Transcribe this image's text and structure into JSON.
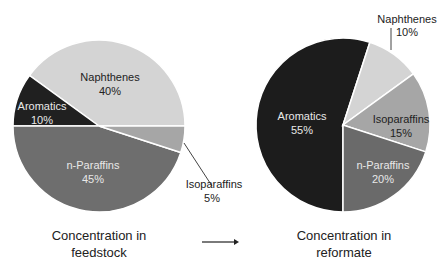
{
  "chart_data": [
    {
      "type": "pie",
      "title": "Concentration in feedstock",
      "categories": [
        "Naphthenes",
        "Aromatics",
        "n-Paraffins",
        "Isoparaffins"
      ],
      "values": [
        40,
        10,
        45,
        5
      ],
      "labels": [
        "40%",
        "10%",
        "45%",
        "5%"
      ],
      "colors": [
        "#d4d4d4",
        "#202020",
        "#6e6e6e",
        "#a6a6a6"
      ],
      "label_colors": [
        "#222222",
        "#e8e8e8",
        "#e8e8e8",
        "#222222"
      ],
      "center": [
        99,
        126
      ],
      "radius": 86,
      "start_angles_deg": [
        0,
        144,
        180,
        -18
      ],
      "external_labels": [
        "Isoparaffins"
      ]
    },
    {
      "type": "pie",
      "title": "Concentration in reformate",
      "categories": [
        "Aromatics",
        "Naphthenes",
        "Isoparaffins",
        "n-Paraffins"
      ],
      "values": [
        55,
        10,
        15,
        20
      ],
      "labels": [
        "55%",
        "10%",
        "15%",
        "20%"
      ],
      "colors": [
        "#1c1c1c",
        "#d4d4d4",
        "#a6a6a6",
        "#6a6a6a"
      ],
      "label_colors": [
        "#e8e8e8",
        "#222222",
        "#222222",
        "#e8e8e8"
      ],
      "center": [
        343,
        125
      ],
      "radius": 87,
      "external_labels": [
        "Naphthenes"
      ]
    }
  ],
  "captions": {
    "left_line1": "Concentration in",
    "left_line2": "feedstock",
    "right_line1": "Concentration in",
    "right_line2": "reformate"
  },
  "labels": {
    "left": {
      "naphthenes": "Naphthenes",
      "naphthenes_pct": "40%",
      "aromatics": "Aromatics",
      "aromatics_pct": "10%",
      "nparaffins": "n-Paraffins",
      "nparaffins_pct": "45%",
      "isoparaffins": "Isoparaffins",
      "isoparaffins_pct": "5%"
    },
    "right": {
      "aromatics": "Aromatics",
      "aromatics_pct": "55%",
      "naphthenes": "Naphthenes",
      "naphthenes_pct": "10%",
      "isoparaffins": "Isoparaffins",
      "isoparaffins_pct": "15%",
      "nparaffins": "n-Paraffins",
      "nparaffins_pct": "20%"
    }
  },
  "arrow": "→"
}
